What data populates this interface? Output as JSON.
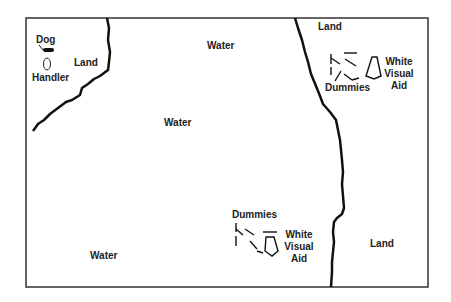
{
  "diagram": {
    "type": "field-map",
    "colors": {
      "border": "#333333",
      "shoreline": "#111111",
      "background": "#ffffff",
      "text": "#222222"
    },
    "labels": {
      "dog": "Dog",
      "handler": "Handler",
      "land_top_left": "Land",
      "water_top": "Water",
      "water_middle": "Water",
      "water_bottom_left": "Water",
      "land_top_right": "Land",
      "land_bottom_right": "Land",
      "dummies_top": "Dummies",
      "dummies_bottom": "Dummies",
      "visual_aid_top": [
        "White",
        "Visual",
        "Aid"
      ],
      "visual_aid_bottom": [
        "White",
        "Visual",
        "Aid"
      ]
    },
    "icons": {
      "dog": "dog-icon",
      "handler": "handler-oval-icon",
      "dummies": "dummies-cluster-icon",
      "visual_aid": "triangle-visual-aid-icon"
    }
  }
}
